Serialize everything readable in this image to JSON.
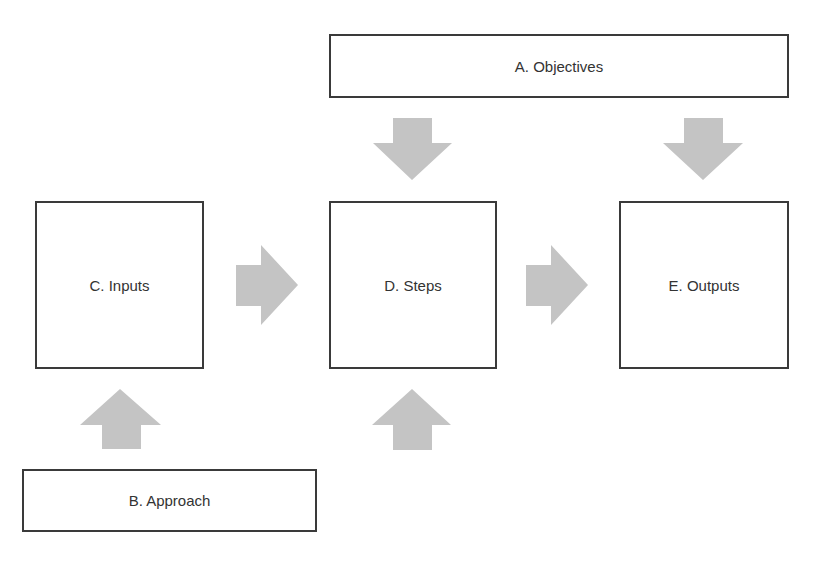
{
  "diagram": {
    "boxes": {
      "objectives": {
        "label": "A. Objectives"
      },
      "approach": {
        "label": "B. Approach"
      },
      "inputs": {
        "label": "C. Inputs"
      },
      "steps": {
        "label": "D. Steps"
      },
      "outputs": {
        "label": "E. Outputs"
      }
    },
    "arrows": [
      {
        "from": "A. Objectives",
        "to": "D. Steps",
        "direction": "down"
      },
      {
        "from": "A. Objectives",
        "to": "E. Outputs",
        "direction": "down"
      },
      {
        "from": "C. Inputs",
        "to": "D. Steps",
        "direction": "right"
      },
      {
        "from": "D. Steps",
        "to": "E. Outputs",
        "direction": "right"
      },
      {
        "from": "B. Approach",
        "to": "C. Inputs",
        "direction": "up"
      },
      {
        "from": "B. Approach",
        "to": "D. Steps",
        "direction": "up"
      }
    ],
    "colors": {
      "arrow_fill": "#c4c4c4",
      "box_border": "#3a3a3a",
      "text": "#333333",
      "background": "#ffffff"
    }
  }
}
